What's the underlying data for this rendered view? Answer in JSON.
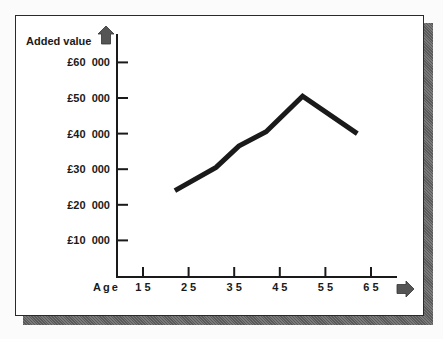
{
  "chart_data": {
    "type": "line",
    "title": "",
    "xlabel": "Age",
    "ylabel": "Added value",
    "x_ticks": [
      "1 5",
      "2 5",
      "3 5",
      "4 5",
      "5 5",
      "6 5"
    ],
    "x_tick_values": [
      15,
      25,
      35,
      45,
      55,
      65
    ],
    "y_ticks": [
      "£10  000",
      "£20  000",
      "£30  000",
      "£40  000",
      "£50  000",
      "£60  000"
    ],
    "y_tick_values": [
      10000,
      20000,
      30000,
      40000,
      50000,
      60000
    ],
    "xlim": [
      9.5,
      69
    ],
    "ylim": [
      0,
      67000
    ],
    "grid": false,
    "legend": null,
    "series": [
      {
        "name": "Added value",
        "x": [
          22,
          31,
          36,
          42,
          50,
          62
        ],
        "values": [
          24000,
          30500,
          36500,
          40500,
          50500,
          40000
        ],
        "color": "#1a1a1a"
      }
    ]
  },
  "labels": {
    "y_axis_title": "Added value",
    "x_axis_title": "Age"
  }
}
